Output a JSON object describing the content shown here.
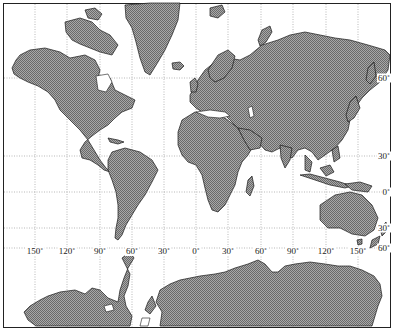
{
  "map": {
    "projection": "Mercator",
    "frame": {
      "left": 3,
      "top": 3,
      "right": 391,
      "bottom": 328
    },
    "colors": {
      "land_fill": "#9a9a9a",
      "land_hatch": "#6e6e6e",
      "coast": "#1a1a1a",
      "grid": "#8a8a8a",
      "ocean": "#ffffff",
      "border": "#222222"
    },
    "longitude_labels": [
      {
        "text": "150˚",
        "x": 35
      },
      {
        "text": "120˚",
        "x": 67
      },
      {
        "text": "90˚",
        "x": 100
      },
      {
        "text": "60˚",
        "x": 132
      },
      {
        "text": "30˚",
        "x": 164
      },
      {
        "text": "0˚",
        "x": 196
      },
      {
        "text": "30˚",
        "x": 228
      },
      {
        "text": "60˚",
        "x": 261
      },
      {
        "text": "90˚",
        "x": 293
      },
      {
        "text": "120˚",
        "x": 326
      },
      {
        "text": "150˚",
        "x": 358
      }
    ],
    "latitude_labels": [
      {
        "text": "60˚",
        "y": 78
      },
      {
        "text": "30˚",
        "y": 156
      },
      {
        "text": "0˚",
        "y": 192
      },
      {
        "text": "30˚",
        "y": 228
      },
      {
        "text": "60˚",
        "y": 248
      }
    ],
    "meridians_x": [
      35,
      67,
      100,
      132,
      164,
      196,
      228,
      261,
      293,
      326,
      358
    ],
    "parallels_y": [
      78,
      156,
      192,
      228,
      248
    ]
  }
}
